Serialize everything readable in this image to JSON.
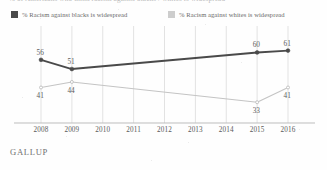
{
  "title": {
    "clipped_text": "% of Americans who think racism against blacks / whites is widespread"
  },
  "legend": {
    "items": [
      {
        "label": "% Racism against blacks is widespread",
        "color": "#4a4a4a",
        "key": "blacks"
      },
      {
        "label": "% Racism against whites is widespread",
        "color": "#c9c9c9",
        "key": "whites"
      }
    ]
  },
  "footer": {
    "source": "GALLUP"
  },
  "colors": {
    "dark_series": "#4a4a4a",
    "light_series": "#c4c4c4",
    "gridline": "#e2e2e2",
    "axis": "#bdbdbd",
    "label_text": "#5d5d5d"
  },
  "chart_data": {
    "type": "line",
    "title": "% of Americans who think racism against blacks / whites is widespread",
    "xlabel": "",
    "ylabel": "",
    "x": [
      2008,
      2009,
      2010,
      2011,
      2012,
      2013,
      2014,
      2015,
      2016
    ],
    "tick_labels": [
      "2008",
      "2009",
      "2010",
      "2011",
      "2012",
      "2013",
      "2014",
      "2015",
      "2016"
    ],
    "xlim": [
      2008,
      2016
    ],
    "ylim": [
      25,
      70
    ],
    "grid": "vertical",
    "legend_position": "top",
    "series": [
      {
        "name": "% Racism against blacks is widespread",
        "color": "#4a4a4a",
        "label_position": "above",
        "points": [
          {
            "x": 2008,
            "y": 56,
            "label": "56",
            "marker": true
          },
          {
            "x": 2009,
            "y": 51,
            "label": "51",
            "marker": true
          },
          {
            "x": 2015,
            "y": 60,
            "label": "60",
            "marker": true
          },
          {
            "x": 2016,
            "y": 61,
            "label": "61",
            "marker": true
          }
        ]
      },
      {
        "name": "% Racism against whites is widespread",
        "color": "#c4c4c4",
        "label_position": "below",
        "points": [
          {
            "x": 2008,
            "y": 41,
            "label": "41",
            "marker": true
          },
          {
            "x": 2009,
            "y": 44,
            "label": "44",
            "marker": true
          },
          {
            "x": 2015,
            "y": 33,
            "label": "33",
            "marker": true
          },
          {
            "x": 2016,
            "y": 41,
            "label": "41",
            "marker": true
          }
        ]
      }
    ]
  }
}
